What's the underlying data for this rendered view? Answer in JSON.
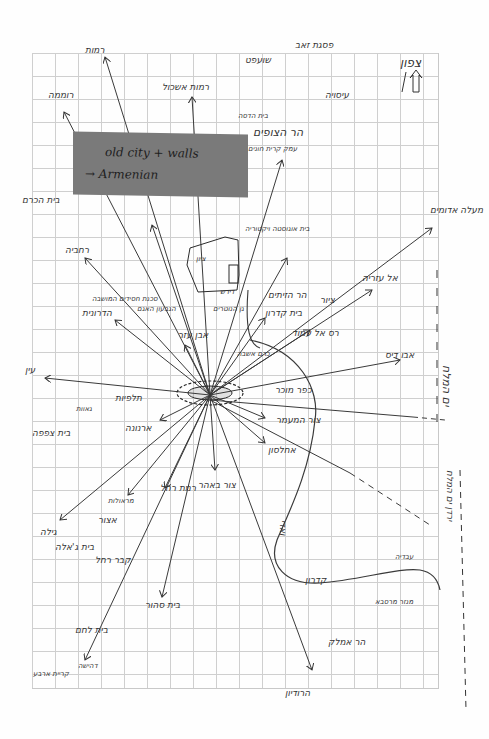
{
  "colors": {
    "paper": "#fefefe",
    "grid": "#cfcfcf",
    "ink": "#333333",
    "sticky_note": "#7a7a7a"
  },
  "compass": {
    "label": "צפון",
    "icon": "north-arrow-icon"
  },
  "sticky_note": {
    "line1": "old city + walls",
    "line2": "→ Armenian"
  },
  "labels": {
    "top_pisgat_zeev": "פסגת זאב",
    "shuafat": "שועפט",
    "ramot": "רמות",
    "ramot_eshkol": "רמות אשכול",
    "romema": "רוממה",
    "isawiya": "עיסויה",
    "beit_hadassah": "בית הדסה",
    "har_hatzofim": "הר הצופים",
    "hatzofim_sub": "עמק קרית חונים",
    "beit_hakerem": "בית הכרם",
    "rehavia": "רחביה",
    "talbieh_area": "סכנת חסידים המושבה",
    "hamiktzav": "הגבעון האגם",
    "hadar_area": "הדרונית",
    "even_ezer": "אבן עזר",
    "tzion": "ציון",
    "kotel_ishra": "כרם אשבה",
    "tziyon_center": "הציון",
    "city_center": "הציון ההעיצה",
    "dirshon": "דירש",
    "gan_nemol": "גן הנוטרים",
    "yefet": "נבי ספוק",
    "hazit": "ציר הזית",
    "beit_ugvat": "בית אוגוסטה ויקטוריה",
    "har_hazeitim": "הר הזיתים",
    "beit_kedron": "בית קדרון",
    "ras_al_amud": "רס אל עמוד",
    "el_azaria": "אל עזריה",
    "sur": "ציור",
    "maale_adumim": "מעלה אדומים",
    "abu_dis": "אבו דיס",
    "kfar_mosar": "כפר מוכר",
    "tzur_ha_omer": "צור המעמר",
    "akhlaton": "אחלסון",
    "dead_sea_right": "ים המלח",
    "ein": "עין",
    "yemin": "ימין",
    "talpiot": "תלפיות",
    "valley": "גאוות",
    "beit_tzafafa": "בית צפפה",
    "arnona": "ארנונה",
    "ramat_rachel": "רמת רחל",
    "marallot": "מראולות",
    "atzur": "אצור",
    "gila": "גילה",
    "beit_jala": "בית ג'אלה",
    "kever_rachel": "קבר רחל",
    "beit_sahur": "בית סהור",
    "beit_lechem": "בית לחם",
    "dahisha": "דהישה",
    "kiryat_arba": "קריית ארבע",
    "sur_bahir": "צור באהר",
    "kidron": "קדרון",
    "wadi": "ואדי",
    "ubeidiya": "עבדיה",
    "mar_saba": "מנזר מרסבא",
    "har_amal": "הר אמלק",
    "herodion": "הרודיון",
    "east_arrow_text": "ירדן ים המלח"
  }
}
